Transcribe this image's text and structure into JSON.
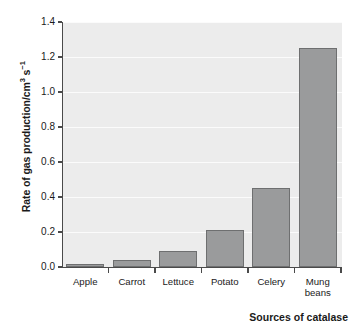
{
  "chart_data": {
    "type": "bar",
    "title": "",
    "categories": [
      "Apple",
      "Carrot",
      "Lettuce",
      "Potato",
      "Celery",
      "Mung beans"
    ],
    "values": [
      0.02,
      0.04,
      0.09,
      0.21,
      0.45,
      1.25
    ],
    "xlabel": "Sources of catalase",
    "ylabel": "Rate of gas production/cm3 s-1",
    "ylabel_parts": {
      "prefix": "Rate of gas production/cm",
      "sup1": "3",
      "mid": " s",
      "sup2": "−1"
    },
    "ylim": [
      0.0,
      1.4
    ],
    "ytick_labels": [
      "0.0",
      "0.2",
      "0.4",
      "0.6",
      "0.8",
      "1.0",
      "1.2",
      "1.4"
    ],
    "ytick_values": [
      0.0,
      0.2,
      0.4,
      0.6,
      0.8,
      1.0,
      1.2,
      1.4
    ],
    "grid": true,
    "legend": "none",
    "colors": {
      "bar_fill": "#9a9b9c",
      "bar_edge": "#6e6f70",
      "plot_background": "#ececec",
      "gridline": "#fbfbfb",
      "axis": "#4a4a4a",
      "text": "#1a1a1a",
      "page_background": "#ffffff"
    }
  }
}
